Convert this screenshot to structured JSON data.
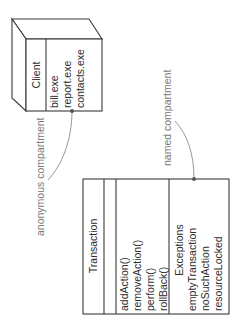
{
  "diagram": {
    "node": {
      "name": "Client",
      "compartment": [
        "bill.exe",
        "report.exe",
        "contacts.exe"
      ]
    },
    "class": {
      "name": "Transaction",
      "operations": [
        "addAction()",
        "removeAction()",
        "perform()",
        "rollBack()"
      ],
      "named_compartment": {
        "title": "Exceptions",
        "items": [
          "emptyTransaction",
          "noSuchAction",
          "resourceLocked"
        ]
      }
    },
    "annotations": {
      "anonymous": "anonymous compartment",
      "named": "named compartment"
    }
  }
}
